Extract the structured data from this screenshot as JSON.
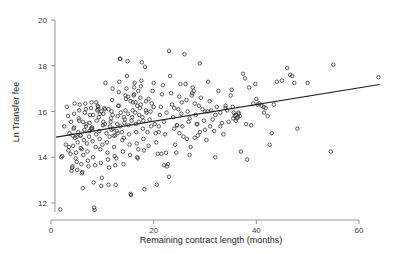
{
  "chart_data": {
    "type": "scatter",
    "title": "",
    "xlabel": "Remaining contract length (months)",
    "ylabel": "Ln Transfer fee",
    "xlim": [
      0,
      65
    ],
    "ylim": [
      11.6,
      20
    ],
    "xticks": [
      0,
      20,
      40,
      60
    ],
    "yticks": [
      12,
      14,
      16,
      18,
      20
    ],
    "xtick_labels": [
      "0",
      "20",
      "40",
      "60"
    ],
    "ytick_labels": [
      "12",
      "14",
      "16",
      "18",
      "20"
    ],
    "grid": false,
    "legend": "none",
    "marker": "open-circle",
    "marker_color": "#2b2b2b",
    "line_color": "#1f1f1f",
    "series": [
      {
        "name": "Observations",
        "x": [
          1.8,
          2.2,
          2.6,
          2.9,
          3.1,
          3.3,
          3.4,
          3.6,
          3.8,
          3.9,
          4.0,
          4.1,
          4.2,
          4.3,
          4.4,
          4.5,
          4.6,
          4.7,
          4.8,
          4.9,
          5.0,
          5.1,
          5.2,
          5.3,
          5.4,
          5.5,
          5.6,
          5.7,
          5.8,
          5.9,
          6.0,
          6.1,
          6.2,
          6.3,
          6.4,
          6.5,
          6.6,
          6.7,
          6.8,
          6.9,
          7.0,
          7.1,
          7.2,
          7.3,
          7.4,
          7.5,
          7.6,
          7.8,
          7.9,
          8.0,
          8.1,
          8.2,
          8.3,
          8.4,
          8.5,
          8.6,
          8.7,
          8.8,
          8.9,
          9.0,
          9.1,
          9.2,
          9.3,
          9.4,
          9.5,
          9.6,
          9.7,
          9.8,
          9.9,
          10.0,
          10.1,
          10.2,
          10.4,
          10.5,
          10.6,
          10.8,
          10.9,
          11.0,
          11.1,
          11.2,
          11.3,
          11.4,
          11.5,
          11.6,
          11.7,
          11.8,
          11.9,
          12.0,
          12.1,
          12.2,
          12.3,
          12.4,
          12.5,
          12.6,
          12.7,
          12.8,
          12.9,
          13.0,
          13.1,
          13.2,
          13.3,
          13.4,
          13.5,
          13.6,
          13.8,
          13.9,
          14.0,
          14.1,
          14.2,
          14.3,
          14.4,
          14.5,
          14.6,
          14.7,
          14.8,
          14.9,
          15.0,
          15.1,
          15.2,
          15.3,
          15.4,
          15.5,
          15.6,
          15.7,
          15.8,
          15.9,
          16.0,
          16.1,
          16.2,
          16.3,
          16.4,
          16.5,
          16.6,
          16.7,
          16.8,
          16.9,
          17.0,
          17.1,
          17.2,
          17.3,
          17.4,
          17.5,
          17.6,
          17.7,
          17.8,
          17.9,
          18.0,
          18.1,
          18.2,
          18.3,
          18.5,
          18.6,
          18.8,
          19.0,
          19.2,
          19.4,
          19.6,
          19.8,
          20.0,
          20.2,
          20.4,
          20.6,
          20.8,
          21.0,
          21.2,
          21.4,
          21.6,
          21.8,
          22.0,
          22.2,
          22.4,
          22.6,
          22.8,
          23.0,
          23.2,
          23.4,
          23.6,
          23.8,
          24.0,
          24.2,
          24.4,
          24.6,
          24.8,
          25.0,
          25.2,
          25.4,
          25.6,
          25.8,
          26.0,
          26.2,
          26.4,
          26.6,
          26.8,
          27.0,
          27.2,
          27.4,
          27.6,
          27.8,
          28.0,
          28.2,
          28.4,
          28.6,
          28.8,
          29.0,
          29.2,
          29.5,
          29.8,
          30.0,
          30.3,
          30.6,
          30.9,
          31.2,
          31.5,
          31.8,
          32.0,
          32.3,
          32.6,
          33.0,
          33.3,
          33.6,
          34.0,
          34.3,
          34.6,
          35.0,
          35.2,
          35.4,
          35.6,
          35.8,
          36.0,
          36.2,
          36.4,
          36.6,
          36.8,
          37.0,
          37.4,
          37.8,
          38.2,
          38.6,
          39.0,
          39.4,
          39.8,
          40.2,
          40.6,
          41.0,
          41.4,
          41.8,
          42.2,
          42.6,
          43.0,
          43.4,
          44.0,
          45.0,
          46.0,
          46.6,
          47.0,
          47.4,
          48.0,
          50.0,
          54.5,
          55.0,
          63.8,
          2.0,
          4.2,
          5.5,
          6.8,
          7.5,
          8.2,
          9.2,
          10.5,
          11.8,
          13.0,
          14.2,
          15.5,
          16.8,
          18.0,
          19.5,
          21.0,
          22.5,
          24.0,
          25.5,
          27.0,
          28.5,
          30.0,
          32.0,
          34.0,
          36.0,
          8.8,
          9.5,
          23.0,
          26.5,
          12.5,
          15.0,
          17.5,
          20.5,
          5.0,
          6.2,
          7.8,
          11.2,
          13.5,
          16.2,
          19.0,
          22.0,
          28.0,
          31.0,
          35.5,
          40.0,
          4.5,
          6.0,
          9.8,
          12.0,
          14.5,
          17.0,
          20.0,
          24.5,
          29.0,
          33.0,
          38.0,
          41.5,
          3.5,
          5.8,
          8.0,
          10.2,
          13.2,
          16.5,
          18.5,
          21.5,
          25.0,
          27.5,
          30.5,
          36.5
        ],
        "y": [
          11.72,
          14.05,
          15.35,
          14.55,
          16.2,
          15.8,
          14.3,
          15.05,
          14.15,
          15.55,
          13.4,
          13.55,
          13.6,
          14.5,
          15.25,
          15.9,
          16.35,
          14.85,
          13.95,
          14.2,
          13.8,
          13.45,
          14.65,
          15.1,
          15.7,
          16.05,
          16.3,
          14.95,
          14.4,
          13.7,
          13.3,
          13.35,
          12.65,
          14.1,
          14.75,
          15.2,
          15.95,
          16.35,
          16.1,
          15.45,
          14.6,
          14.25,
          13.85,
          13.6,
          14.9,
          15.5,
          15.85,
          16.15,
          16.4,
          15.3,
          14.7,
          14.0,
          12.9,
          11.8,
          11.7,
          13.65,
          14.45,
          15.0,
          15.6,
          16.05,
          16.25,
          16.2,
          15.75,
          15.15,
          14.8,
          14.35,
          13.75,
          12.75,
          13.1,
          14.55,
          15.4,
          15.9,
          16.15,
          16.1,
          17.25,
          15.05,
          14.65,
          14.2,
          13.9,
          12.8,
          13.55,
          14.9,
          15.35,
          15.55,
          15.7,
          16.0,
          16.5,
          17.0,
          15.25,
          14.95,
          14.45,
          14.05,
          13.65,
          12.8,
          13.95,
          15.15,
          15.45,
          15.8,
          16.25,
          16.85,
          17.3,
          18.3,
          18.3,
          15.95,
          15.1,
          14.75,
          14.25,
          13.7,
          14.85,
          15.5,
          15.65,
          16.05,
          16.55,
          17.0,
          17.55,
          18.2,
          15.9,
          15.4,
          15.0,
          14.55,
          14.1,
          12.4,
          12.35,
          15.6,
          15.75,
          16.05,
          16.4,
          16.7,
          17.05,
          17.25,
          15.95,
          15.45,
          15.1,
          14.6,
          14.0,
          13.95,
          14.35,
          15.55,
          15.85,
          16.15,
          16.6,
          17.1,
          17.35,
          18.15,
          15.75,
          15.25,
          14.8,
          14.3,
          12.6,
          17.95,
          16.45,
          15.95,
          15.1,
          14.5,
          15.65,
          16.0,
          16.35,
          16.9,
          17.25,
          15.45,
          15.05,
          12.8,
          14.15,
          15.35,
          15.85,
          16.2,
          16.75,
          17.15,
          15.55,
          15.0,
          14.2,
          13.6,
          13.7,
          18.65,
          17.55,
          16.8,
          16.3,
          15.75,
          15.25,
          14.55,
          14.2,
          15.4,
          16.1,
          16.65,
          17.2,
          15.9,
          15.35,
          14.9,
          18.5,
          17.2,
          16.5,
          16.0,
          15.55,
          14.1,
          14.45,
          16.7,
          17.05,
          16.9,
          16.35,
          15.85,
          15.45,
          14.95,
          16.25,
          18.1,
          16.6,
          16.1,
          15.6,
          15.2,
          14.75,
          17.3,
          16.45,
          16.05,
          15.65,
          15.15,
          14.0,
          16.2,
          16.9,
          15.95,
          15.5,
          15.0,
          16.15,
          16.05,
          15.55,
          16.7,
          16.95,
          16.2,
          15.95,
          15.8,
          15.85,
          15.7,
          15.75,
          15.9,
          15.8,
          14.25,
          17.65,
          17.45,
          13.9,
          17.05,
          15.4,
          16.35,
          17.2,
          16.3,
          16.35,
          16.25,
          16.2,
          16.15,
          15.8,
          14.55,
          15.05,
          16.3,
          17.3,
          17.35,
          17.9,
          17.6,
          17.55,
          17.25,
          15.25,
          17.25,
          14.25,
          18.05,
          17.5,
          14.0,
          14.95,
          15.6,
          15.35,
          15.15,
          15.85,
          16.1,
          15.45,
          15.2,
          15.05,
          15.75,
          16.45,
          16.25,
          15.6,
          15.35,
          15.1,
          15.95,
          16.15,
          16.4,
          15.7,
          15.45,
          16.0,
          15.85,
          16.25,
          15.6,
          16.4,
          15.9,
          13.15,
          14.8,
          14.95,
          16.65,
          16.3,
          14.65,
          14.9,
          15.55,
          15.25,
          16.1,
          15.35,
          16.75,
          16.55,
          13.65,
          14.85,
          15.35,
          15.7,
          16.55,
          15.3,
          14.35,
          16.0,
          15.85,
          16.7,
          16.9,
          16.2,
          15.4,
          15.1,
          15.35,
          15.45,
          15.95,
          14.45,
          14.95,
          15.25,
          15.55,
          16.25,
          16.4,
          16.05,
          14.15,
          15.05,
          16.8,
          16.0,
          15.95
        ],
        "marker": "o",
        "filled": false
      }
    ],
    "fit_line": {
      "name": "linear fit",
      "x_start": 1.0,
      "x_end": 64.0,
      "y_start": 14.88,
      "y_end": 17.18
    }
  }
}
